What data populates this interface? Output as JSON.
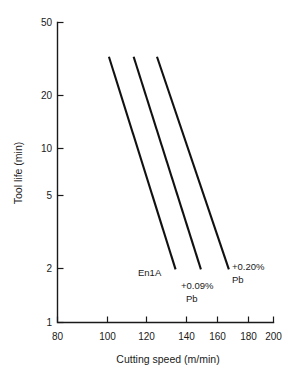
{
  "chart_data": {
    "type": "line",
    "title": "",
    "xlabel": "Cutting speed (m/min)",
    "ylabel": "Tool life (min)",
    "xscale": "log",
    "yscale": "log",
    "xlim": [
      80,
      200
    ],
    "ylim": [
      1,
      50
    ],
    "grid": false,
    "legend": "inline-annotations",
    "xticks": [
      80,
      100,
      120,
      140,
      160,
      180,
      200
    ],
    "xtick_labels": [
      "80",
      "100",
      "120",
      "140",
      "160",
      "180",
      "200"
    ],
    "yticks": [
      1,
      2,
      5,
      10,
      20,
      50
    ],
    "ytick_labels": [
      "1",
      "2",
      "5",
      "10",
      "20",
      "50"
    ],
    "series": [
      {
        "name": "En1A",
        "label": "En1A",
        "label_lines": [
          "En1A"
        ],
        "points": [
          {
            "x": 99.5,
            "y": 32
          },
          {
            "x": 132,
            "y": 2
          }
        ]
      },
      {
        "name": "+0.09% Pb",
        "label": "+0.09%\nPb",
        "label_lines": [
          "+0.09%",
          "Pb"
        ],
        "points": [
          {
            "x": 110.5,
            "y": 32
          },
          {
            "x": 147,
            "y": 2
          }
        ]
      },
      {
        "name": "+0.20% Pb",
        "label": "+0.20%\nPb",
        "label_lines": [
          "+0.20%",
          "Pb"
        ],
        "points": [
          {
            "x": 122,
            "y": 32
          },
          {
            "x": 165.5,
            "y": 2
          }
        ]
      }
    ]
  },
  "axes": {
    "x_title": "Cutting speed (m/min)",
    "y_title": "Tool life (min)",
    "x_tick_labels": [
      "80",
      "100",
      "120",
      "140",
      "160",
      "180",
      "200"
    ],
    "y_tick_labels": [
      "50",
      "20",
      "10",
      "5",
      "2",
      "1"
    ]
  },
  "annotations": {
    "en1a": "En1A",
    "pb009_line1": "+0.09%",
    "pb009_line2": "Pb",
    "pb020_line1": "+0.20%",
    "pb020_line2": "Pb"
  },
  "colors": {
    "ink": "#1a1a1a",
    "curve": "#111111",
    "background": "#ffffff"
  }
}
